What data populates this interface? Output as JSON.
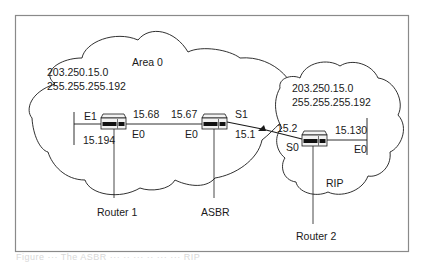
{
  "diagram": {
    "clouds": {
      "area0": {
        "name": "Area 0",
        "network": "203.250.15.0",
        "mask": "255.255.255.192"
      },
      "rip": {
        "name": "RIP",
        "network": "203.250.15.0",
        "mask": "255.255.255.192"
      }
    },
    "routers": {
      "router1": {
        "label": "Router 1",
        "e1": "E1",
        "e0": "E0",
        "e1_addr": "15.194",
        "e0_addr": "15.68"
      },
      "asbr": {
        "label": "ASBR",
        "e0": "E0",
        "s1": "S1",
        "e0_addr": "15.67",
        "s1_addr": "15.1"
      },
      "router2": {
        "label": "Router 2",
        "s0": "S0",
        "e0": "E0",
        "s0_addr": "15.2",
        "e0_addr": "15.130"
      }
    },
    "colors": {
      "line": "#1a1a1a",
      "frame": "#8a8a8a",
      "router_body": "#f2f2f2",
      "router_panel": "#111111"
    }
  },
  "caption": {
    "text": "Figure ···  The ASBR ··· ·· ··· ·· ··· ··· RIP"
  }
}
